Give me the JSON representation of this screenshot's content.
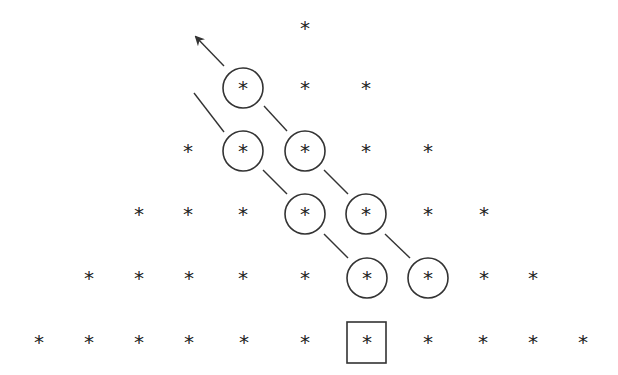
{
  "diagram": {
    "glyph": "*",
    "stroke_color": "#333333",
    "rows": [
      {
        "y": 28,
        "xs": [
          305
        ]
      },
      {
        "y": 88,
        "xs": [
          243,
          305,
          366
        ]
      },
      {
        "y": 151,
        "xs": [
          188,
          243,
          305,
          366,
          428
        ]
      },
      {
        "y": 214,
        "xs": [
          139,
          188,
          243,
          305,
          366,
          428,
          484
        ]
      },
      {
        "y": 278,
        "xs": [
          89,
          139,
          189,
          243,
          305,
          367,
          428,
          484,
          533
        ]
      },
      {
        "y": 342,
        "xs": [
          39,
          89,
          139,
          189,
          244,
          305,
          367,
          428,
          483,
          533,
          583
        ]
      }
    ],
    "circles": [
      {
        "cx": 243,
        "cy": 88,
        "r": 20
      },
      {
        "cx": 243,
        "cy": 151,
        "r": 20
      },
      {
        "cx": 305,
        "cy": 151,
        "r": 20
      },
      {
        "cx": 305,
        "cy": 214,
        "r": 20
      },
      {
        "cx": 366,
        "cy": 214,
        "r": 20
      },
      {
        "cx": 367,
        "cy": 278,
        "r": 20
      },
      {
        "cx": 428,
        "cy": 278,
        "r": 20
      }
    ],
    "box": {
      "x": 347,
      "y": 322,
      "w": 39,
      "h": 41
    },
    "dashes": [
      [
        194,
        93,
        224,
        132
      ],
      [
        264,
        106,
        287,
        131
      ],
      [
        263,
        170,
        287,
        194
      ],
      [
        324,
        170,
        348,
        194
      ],
      [
        324,
        234,
        348,
        258
      ],
      [
        385,
        234,
        410,
        258
      ]
    ],
    "arrow": {
      "x1": 224,
      "y1": 66,
      "x2": 196,
      "y2": 37
    }
  }
}
